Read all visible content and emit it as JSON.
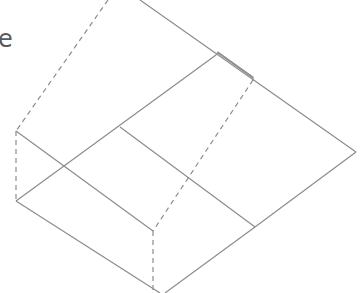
{
  "diagram": {
    "partial_label": "e",
    "stroke_color": "#8c8c8c",
    "solid_lines": [
      [
        140,
        0,
        356,
        152
      ],
      [
        356,
        152,
        255,
        227
      ],
      [
        16,
        201,
        216,
        55
      ],
      [
        16,
        131,
        153,
        231
      ],
      [
        120,
        127,
        255,
        227
      ],
      [
        16,
        201,
        160,
        293
      ],
      [
        255,
        227,
        165,
        293
      ],
      [
        218,
        53,
        253,
        78
      ]
    ],
    "dashed_lines": [
      [
        108,
        0,
        16,
        131
      ],
      [
        16,
        131,
        16,
        201
      ],
      [
        253,
        80,
        153,
        231
      ],
      [
        153,
        231,
        153,
        293
      ]
    ]
  }
}
